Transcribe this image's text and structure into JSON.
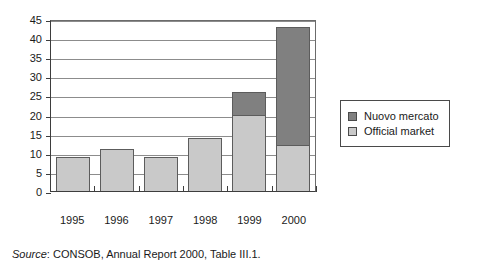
{
  "chart_data": {
    "type": "bar",
    "subtype": "stacked-vertical",
    "title": "",
    "subtitle": "",
    "xlabel": "",
    "ylabel": "",
    "categories": [
      "1995",
      "1996",
      "1997",
      "1998",
      "1999",
      "2000"
    ],
    "series": [
      {
        "name": "Official market",
        "color": "#c9c9c9",
        "values": [
          9,
          11,
          9,
          14,
          20,
          12
        ]
      },
      {
        "name": "Nuovo mercato",
        "color": "#808080",
        "values": [
          0,
          0,
          0,
          0,
          6,
          31
        ]
      }
    ],
    "totals": [
      9,
      11,
      9,
      14,
      26,
      43
    ],
    "ylim": [
      0,
      45
    ],
    "ytick_step": 5,
    "yticks": [
      "45",
      "40",
      "35",
      "30",
      "25",
      "20",
      "15",
      "10",
      "5",
      "0"
    ],
    "ytick_values": [
      45,
      40,
      35,
      30,
      25,
      20,
      15,
      10,
      5,
      0
    ],
    "grid": "horizontal",
    "legend_position": "right",
    "stack_order": [
      "Official market",
      "Nuovo mercato"
    ]
  },
  "legend": {
    "items": [
      {
        "label": "Nuovo mercato",
        "color": "#808080"
      },
      {
        "label": "Official market",
        "color": "#c9c9c9"
      }
    ]
  },
  "source": {
    "prefix": "Source",
    "text": ": CONSOB, Annual Report 2000, Table III.1."
  },
  "colors": {
    "nuovo_mercato": "#808080",
    "official_market": "#c9c9c9",
    "grid": "#8c8c8c",
    "axis": "#3d3d3d",
    "frame": "#6b6b6b",
    "text": "#1a1a1a",
    "background": "#ffffff"
  }
}
